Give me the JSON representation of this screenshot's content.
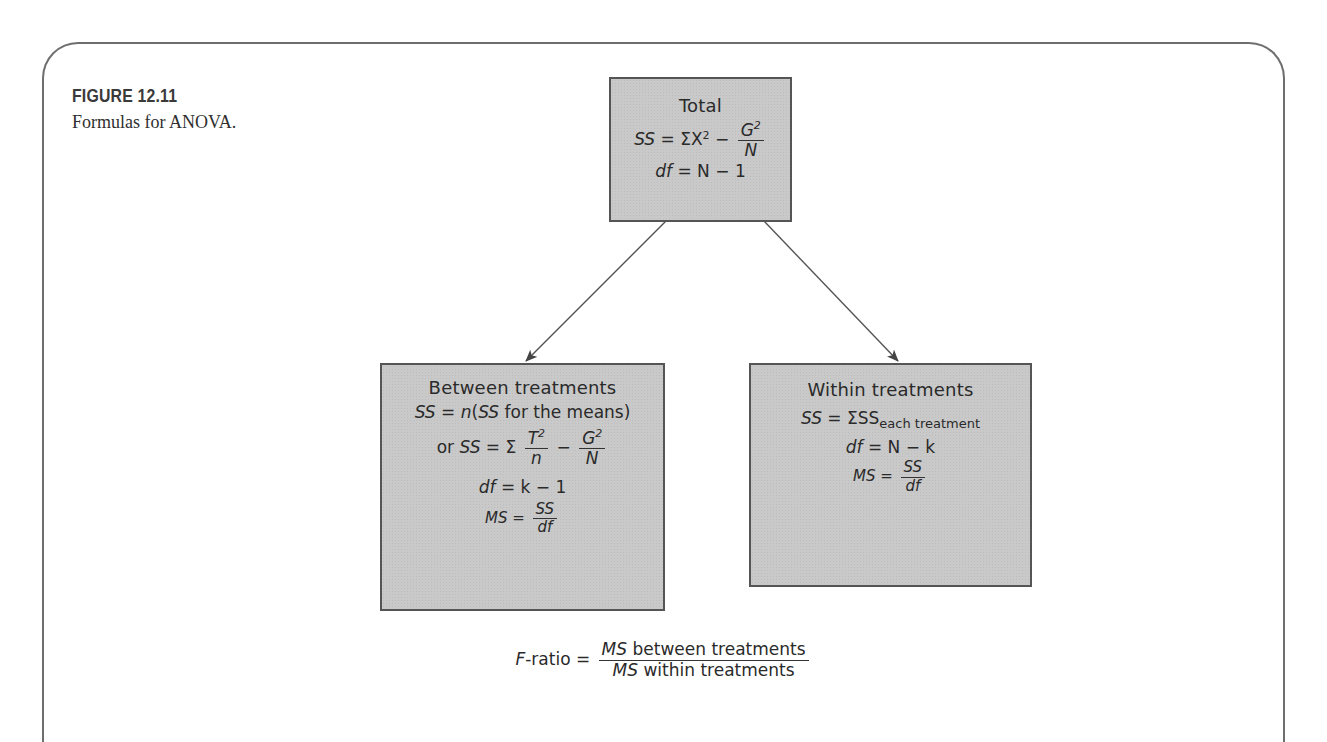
{
  "figure": {
    "label": "FIGURE 12.11",
    "caption": "Formulas for ANOVA."
  },
  "total_box": {
    "title": "Total",
    "ss_lhs": "SS",
    "ss_eq": " = ΣX",
    "ss_sup": "2",
    "ss_minus": " − ",
    "ss_frac_num": "G",
    "ss_frac_num_sup": "2",
    "ss_frac_den": "N",
    "df_lhs": "df",
    "df_rhs": " = N − 1"
  },
  "between_box": {
    "title": "Between treatments",
    "ss1_lhs": "SS",
    "ss1_eq": " = ",
    "ss1_n": "n",
    "ss1_open": "(",
    "ss1_inner": "SS",
    "ss1_rest": " for the means)",
    "ss2_prefix": "or ",
    "ss2_lhs": "SS",
    "ss2_eq": " = Σ",
    "ss2_frac1_num": "T",
    "ss2_frac1_sup": "2",
    "ss2_frac1_den": "n",
    "ss2_minus": "−",
    "ss2_frac2_num": "G",
    "ss2_frac2_sup": "2",
    "ss2_frac2_den": "N",
    "df_lhs": "df",
    "df_rhs": " = k − 1",
    "ms_lhs": "MS",
    "ms_eq": " = ",
    "ms_num": "SS",
    "ms_den": "df"
  },
  "within_box": {
    "title": "Within treatments",
    "ss_lhs": "SS",
    "ss_eq": " = ΣSS",
    "ss_sub": "each treatment",
    "df_lhs": "df",
    "df_rhs": " = N − k",
    "ms_lhs": "MS",
    "ms_eq": " = ",
    "ms_num": "SS",
    "ms_den": "df"
  },
  "f_ratio": {
    "lhs_italic": "F",
    "lhs_rest": "-ratio = ",
    "num_italic": "MS",
    "num_rest": " between treatments",
    "den_italic": "MS",
    "den_rest": " within treatments"
  }
}
